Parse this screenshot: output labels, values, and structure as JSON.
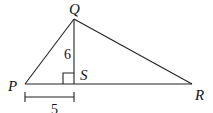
{
  "diagram": {
    "type": "triangle",
    "vertices": {
      "P": {
        "label": "P",
        "x": 25,
        "y": 84
      },
      "Q": {
        "label": "Q",
        "x": 74,
        "y": 19
      },
      "R": {
        "label": "R",
        "x": 192,
        "y": 84
      },
      "S": {
        "label": "S",
        "x": 74,
        "y": 84
      }
    },
    "segments": [
      "PQ",
      "QR",
      "PR",
      "QS"
    ],
    "right_angle_at": "S",
    "measurements": {
      "QS": "6",
      "PS": "5"
    },
    "colors": {
      "line": "#222222",
      "text": "#111111",
      "background": "#ffffff"
    }
  }
}
